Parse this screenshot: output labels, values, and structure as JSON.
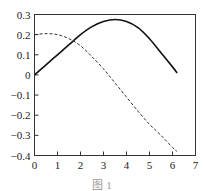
{
  "chart_data": {
    "type": "line",
    "title": "",
    "xlabel": "",
    "ylabel": "",
    "xlim": [
      0,
      7
    ],
    "ylim": [
      -0.4,
      0.3
    ],
    "grid": false,
    "legend": null,
    "x_ticks": [
      "0",
      "1",
      "2",
      "3",
      "4",
      "5",
      "6",
      "7"
    ],
    "y_ticks": [
      "0.3",
      "0.2",
      "0.1",
      "0",
      "-0.1",
      "-0.2",
      "-0.3",
      "-0.4"
    ],
    "x": [
      0,
      0.5,
      1,
      1.5,
      2,
      2.5,
      3,
      3.5,
      4,
      4.5,
      5,
      5.5,
      6,
      6.2
    ],
    "series": [
      {
        "name": "solid",
        "style": "solid",
        "color": "#111111",
        "values": [
          0,
          0.05,
          0.1,
          0.15,
          0.2,
          0.24,
          0.265,
          0.275,
          0.265,
          0.235,
          0.18,
          0.11,
          0.04,
          0.01
        ]
      },
      {
        "name": "dashed",
        "style": "dashed",
        "color": "#333333",
        "values": [
          0.2,
          0.205,
          0.2,
          0.18,
          0.145,
          0.09,
          0.03,
          -0.04,
          -0.11,
          -0.18,
          -0.245,
          -0.3,
          -0.36,
          -0.38
        ]
      }
    ]
  },
  "caption": "图 1"
}
